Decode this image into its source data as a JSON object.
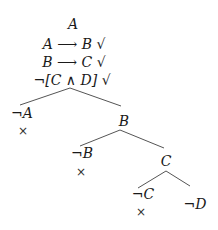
{
  "tableau": {
    "premises": [
      "A",
      "A ⟶ B √",
      "B ⟶ C √",
      "¬[C ∧ D] √"
    ],
    "branch1": {
      "left": "¬A",
      "left_closed": "×",
      "right": "B"
    },
    "branch2": {
      "left": "¬B",
      "left_closed": "×",
      "right": "C"
    },
    "branch3": {
      "left": "¬C",
      "left_closed": "×",
      "right": "¬D"
    }
  }
}
